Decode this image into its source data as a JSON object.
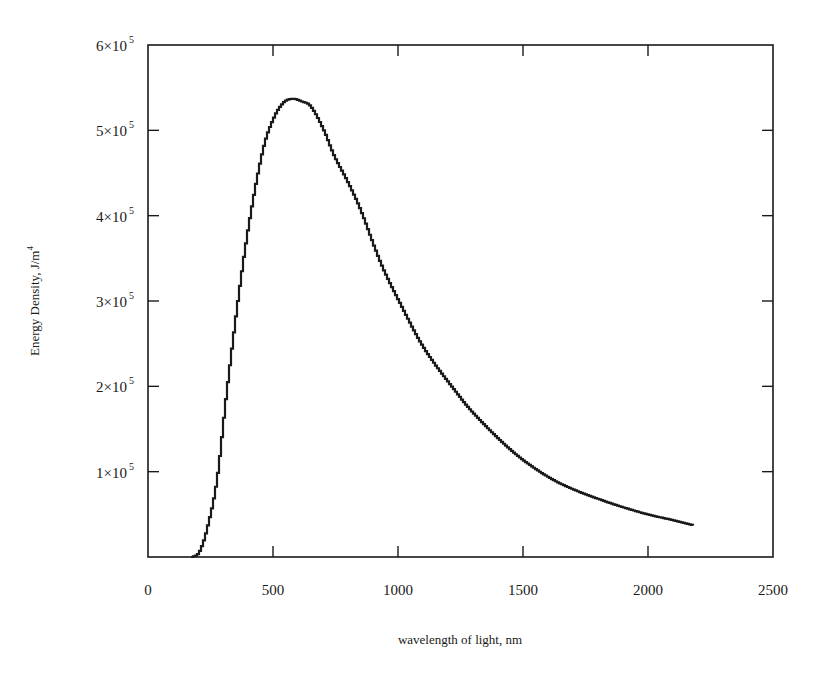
{
  "chart_data": {
    "type": "line",
    "title": "",
    "xlabel": "wavelength of light, nm",
    "ylabel": "Energy Density, J/m",
    "ylabel_superscript": "4",
    "xlim": [
      0,
      2500
    ],
    "ylim": [
      0,
      600000
    ],
    "grid": false,
    "legend": null,
    "x_ticks": [
      0,
      500,
      1000,
      1500,
      2000,
      2500
    ],
    "x_tick_labels": [
      "0",
      "500",
      "1000",
      "1500",
      "2000",
      "2500"
    ],
    "y_ticks": [
      100000,
      200000,
      300000,
      400000,
      500000,
      600000
    ],
    "y_tick_labels": [
      {
        "mantissa": "1×10",
        "exp": "5"
      },
      {
        "mantissa": "2×10",
        "exp": "5"
      },
      {
        "mantissa": "3×10",
        "exp": "5"
      },
      {
        "mantissa": "4×10",
        "exp": "5"
      },
      {
        "mantissa": "5×10",
        "exp": "5"
      },
      {
        "mantissa": "6×10",
        "exp": "5"
      }
    ],
    "series": [
      {
        "name": "Energy Density",
        "style": "stepped line with small tick markers",
        "color": "#1a1a1a",
        "x": [
          172,
          200,
          230,
          272,
          310,
          356,
          400,
          456,
          500,
          540,
          575,
          610,
          648,
          700,
          740,
          800,
          848,
          900,
          940,
          1000,
          1100,
          1248,
          1300,
          1408,
          1500,
          1608,
          1700,
          1808,
          1900,
          2008,
          2100,
          2180
        ],
        "y": [
          0,
          5000,
          30000,
          90000,
          190000,
          300000,
          390000,
          477000,
          515000,
          533000,
          537000,
          534000,
          528000,
          500000,
          471000,
          437000,
          406000,
          365000,
          336000,
          300000,
          245000,
          186000,
          168000,
          136000,
          113000,
          92000,
          79000,
          67000,
          58000,
          49000,
          43000,
          37000
        ]
      }
    ],
    "annotations": []
  },
  "colors": {
    "line": "#1a1a1a",
    "axes": "#1a1a1a",
    "background": "#ffffff"
  }
}
